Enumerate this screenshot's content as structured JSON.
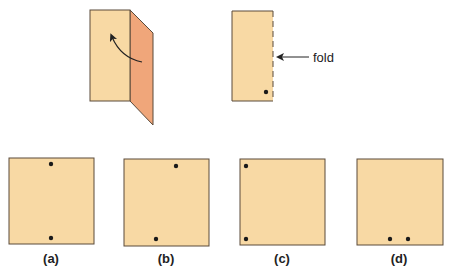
{
  "diagram": {
    "colors": {
      "paper": "#f8d9a4",
      "flap": "#f0a67a",
      "outline": "#5a4a3a",
      "dot": "#1a1a1a",
      "arrow": "#222222"
    },
    "step1": {
      "description": "paper being folded, right flap folding over left",
      "arrow": "curved-arrow"
    },
    "step2": {
      "fold_label": "fold",
      "hole_count": 1
    },
    "options": [
      {
        "label": "(a)",
        "holes": [
          [
            0.5,
            0.06
          ],
          [
            0.5,
            0.93
          ]
        ]
      },
      {
        "label": "(b)",
        "holes": [
          [
            0.61,
            0.07
          ],
          [
            0.37,
            0.92
          ]
        ]
      },
      {
        "label": "(c)",
        "holes": [
          [
            0.06,
            0.07
          ],
          [
            0.06,
            0.93
          ]
        ]
      },
      {
        "label": "(d)",
        "holes": [
          [
            0.39,
            0.93
          ],
          [
            0.6,
            0.93
          ]
        ]
      }
    ]
  }
}
